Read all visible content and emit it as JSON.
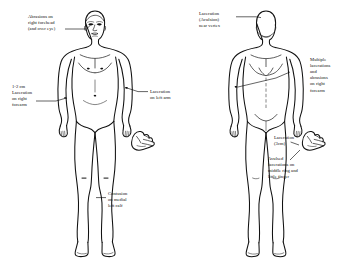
{
  "document": {
    "title": "Body Injury Diagram",
    "figure_count": 2
  },
  "figures": [
    {
      "id": "anterior",
      "view_label": "Anterior (front) view of male body"
    },
    {
      "id": "posterior",
      "view_label": "Posterior (back) view of male body"
    }
  ],
  "annotations": {
    "forehead": {
      "line1": "Abrasions on",
      "line2": "right forehead",
      "line3": "(and over eye)"
    },
    "right_forearm_front": {
      "line1": "1-2 cm",
      "line2": "Laceration",
      "line3": "on right",
      "line4": "forearm"
    },
    "left_arm": {
      "line1": "Laceration",
      "line2": "on left arm"
    },
    "left_calf": {
      "line1": "Contusion",
      "line2": "on medial",
      "line3": "left calf"
    },
    "vertex": {
      "line1": "Laceration",
      "line2": "(Avulsion)",
      "line3": "near vertex"
    },
    "right_forearm_back": {
      "line1": "Multiple",
      "line2": "lacerations",
      "line3": "and",
      "line4": "abrasions",
      "line5": "on right",
      "line6": "forearm"
    },
    "hand_laceration": {
      "line1": "Laceration",
      "line2": "(3cm)"
    },
    "fingers": {
      "line1": "Avulsed",
      "line2": "lacerations on",
      "line3": "middle ring and",
      "line4": "little finger"
    }
  },
  "colors": {
    "ink": "#111111",
    "background": "#ffffff",
    "text": "#0d0d0d"
  }
}
